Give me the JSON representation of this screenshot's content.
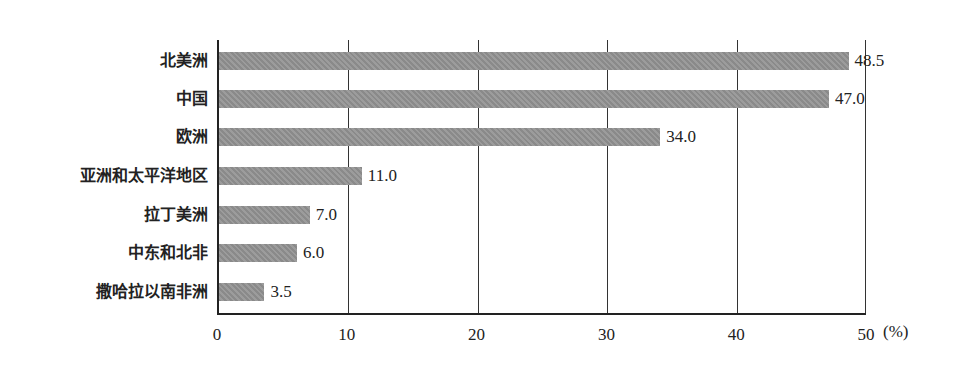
{
  "chart_data": {
    "type": "bar",
    "orientation": "horizontal",
    "title": "",
    "xlabel": "(%)",
    "ylabel": "",
    "xlim": [
      0,
      50
    ],
    "xticks": [
      0,
      10,
      20,
      30,
      40,
      50
    ],
    "grid": "vertical lines at ticks",
    "categories": [
      "北美洲",
      "中国",
      "欧洲",
      "亚洲和太平洋地区",
      "拉丁美洲",
      "中东和北非",
      "撒哈拉以南非洲"
    ],
    "values": [
      48.5,
      47.0,
      34.0,
      11.0,
      7.0,
      6.0,
      3.5
    ],
    "value_labels": [
      "48.5",
      "47.0",
      "34.0",
      "11.0",
      "7.0",
      "6.0",
      "3.5"
    ],
    "bar_color": "#929292"
  },
  "axis": {
    "ticks": [
      "0",
      "10",
      "20",
      "30",
      "40",
      "50"
    ],
    "unit": "(%)"
  }
}
